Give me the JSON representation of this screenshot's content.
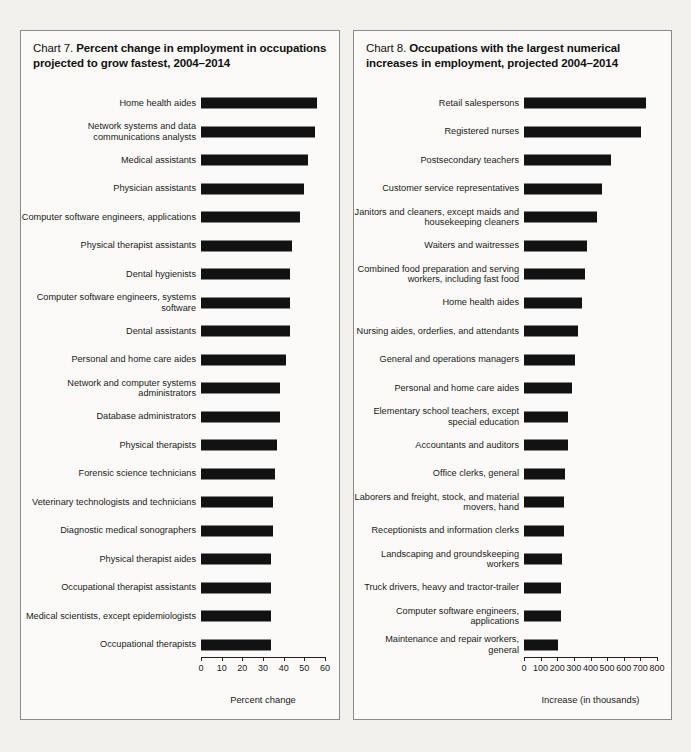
{
  "charts": [
    {
      "id": "chart-7",
      "lead": "Chart 7.",
      "title": "Percent change in employment in occupations projected to grow fastest, 2004–2014",
      "axis_caption": "Percent change",
      "chart_data": {
        "type": "bar",
        "orientation": "horizontal",
        "title": "Chart 7. Percent change in employment in occupations projected to grow fastest, 2004–2014",
        "xlabel": "Percent change",
        "ylabel": "",
        "xlim": [
          0,
          60
        ],
        "xticks": [
          0,
          10,
          20,
          30,
          40,
          50,
          60
        ],
        "grid": false,
        "legend": "none",
        "categories": [
          "Home health aides",
          "Network systems and data communications analysts",
          "Medical assistants",
          "Physician assistants",
          "Computer software engineers, applications",
          "Physical therapist assistants",
          "Dental hygienists",
          "Computer software engineers, systems software",
          "Dental assistants",
          "Personal and home care aides",
          "Network and computer systems administrators",
          "Database administrators",
          "Physical therapists",
          "Forensic science technicians",
          "Veterinary technologists and technicians",
          "Diagnostic medical sonographers",
          "Physical therapist aides",
          "Occupational therapist assistants",
          "Medical scientists, except epidemiologists",
          "Occupational therapists"
        ],
        "values": [
          56,
          55,
          52,
          50,
          48,
          44,
          43,
          43,
          43,
          41,
          38,
          38,
          37,
          36,
          35,
          35,
          34,
          34,
          34,
          34
        ]
      }
    },
    {
      "id": "chart-8",
      "lead": "Chart 8.",
      "title": "Occupations with the largest numerical increases in employment, projected 2004–2014",
      "axis_caption": "Increase (in thousands)",
      "chart_data": {
        "type": "bar",
        "orientation": "horizontal",
        "title": "Chart 8. Occupations with the largest numerical increases in employment, projected 2004–2014",
        "xlabel": "Increase (in thousands)",
        "ylabel": "",
        "xlim": [
          0,
          800
        ],
        "xticks": [
          0,
          100,
          200,
          300,
          400,
          500,
          600,
          700,
          800
        ],
        "grid": false,
        "legend": "none",
        "categories": [
          "Retail salespersons",
          "Registered nurses",
          "Postsecondary teachers",
          "Customer service representatives",
          "Janitors and cleaners, except maids and housekeeping cleaners",
          "Waiters and waitresses",
          "Combined food preparation and serving workers, including fast food",
          "Home health aides",
          "Nursing aides, orderlies, and attendants",
          "General and operations managers",
          "Personal and home care aides",
          "Elementary school teachers, except special education",
          "Accountants and auditors",
          "Office clerks, general",
          "Laborers and freight, stock, and material movers, hand",
          "Receptionists and information clerks",
          "Landscaping and groundskeeping workers",
          "Truck drivers, heavy and tractor-trailer",
          "Computer software engineers, applications",
          "Maintenance and repair workers, general"
        ],
        "values": [
          736,
          703,
          524,
          471,
          440,
          376,
          367,
          350,
          325,
          308,
          287,
          265,
          264,
          246,
          239,
          239,
          230,
          223,
          222,
          202
        ]
      }
    }
  ]
}
